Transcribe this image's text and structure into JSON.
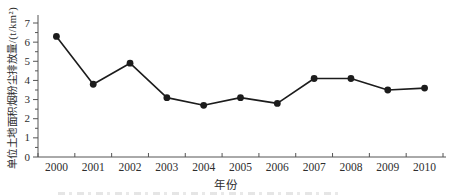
{
  "page": {
    "background": "#ffffff"
  },
  "chart_data": {
    "type": "line",
    "title": "",
    "xlabel": "年份",
    "ylabel": "单位土地面积烟粉尘排放量/(t/km²)",
    "categories": [
      "2000",
      "2001",
      "2002",
      "2003",
      "2004",
      "2005",
      "2006",
      "2007",
      "2008",
      "2009",
      "2010"
    ],
    "series": [
      {
        "name": "单位土地面积烟粉尘排放量",
        "values": [
          6.3,
          3.8,
          4.9,
          3.1,
          2.7,
          3.1,
          2.8,
          4.1,
          4.1,
          3.5,
          3.6
        ]
      }
    ],
    "ylim": [
      0,
      7
    ],
    "ytick_major_step": 1,
    "ytick_minor_step": 0.5,
    "ytick_labels": [
      "0",
      "1",
      "2",
      "3",
      "4",
      "5",
      "6",
      "7"
    ],
    "grid": false,
    "legend_position": "none",
    "line_color": "#1c1c1c",
    "marker": "filled-circle",
    "axis_color": "#555555",
    "text_color": "#2e2e2e"
  }
}
